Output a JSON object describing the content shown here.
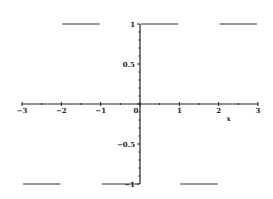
{
  "chart_data": {
    "type": "line",
    "title": "",
    "xlabel": "x",
    "ylabel": "",
    "xlim": [
      -3,
      3
    ],
    "ylim": [
      -1,
      1
    ],
    "grid": false,
    "legend": null,
    "x_ticks": [
      "-3",
      "-2",
      "-1",
      "0",
      "1",
      "2",
      "3"
    ],
    "y_ticks": [
      "1",
      "0.5",
      "-0.5",
      "-1"
    ],
    "series": [
      {
        "name": "square wave",
        "segments": [
          {
            "x": [
              -3,
              -2
            ],
            "y": [
              -1,
              -1
            ]
          },
          {
            "x": [
              -2,
              -1
            ],
            "y": [
              1,
              1
            ]
          },
          {
            "x": [
              -1,
              0
            ],
            "y": [
              -1,
              -1
            ]
          },
          {
            "x": [
              0,
              1
            ],
            "y": [
              1,
              1
            ]
          },
          {
            "x": [
              1,
              2
            ],
            "y": [
              -1,
              -1
            ]
          },
          {
            "x": [
              2,
              3
            ],
            "y": [
              1,
              1
            ]
          }
        ]
      }
    ],
    "colors": {
      "line": "#777777",
      "axis": "#222222"
    }
  }
}
